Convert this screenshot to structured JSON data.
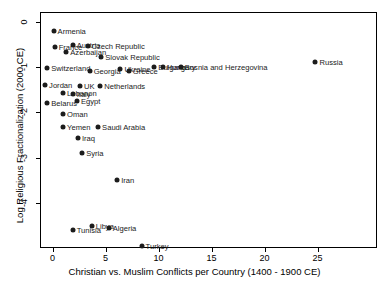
{
  "chart_data": {
    "type": "scatter",
    "title": "",
    "xlabel": "Christian vs. Muslim Conflicts per Country (1400 - 1900 CE)",
    "ylabel": "Log Religious Fractionalization (2000 CE)",
    "x_ticks": [
      0,
      5,
      10,
      15,
      20,
      25
    ],
    "y_ticks": [
      0,
      -1,
      -2,
      -3,
      -4
    ],
    "xlim": [
      -1.18,
      30.6
    ],
    "ylim": [
      -4.98,
      0.21
    ],
    "grid": false,
    "legend": "none",
    "marker_color": "#1c1c1c",
    "points": [
      {
        "label": "Armenia",
        "x": 0.1,
        "y": -0.2
      },
      {
        "label": "France",
        "x": 0.2,
        "y": -0.56
      },
      {
        "label": "Austria",
        "x": 1.9,
        "y": -0.52
      },
      {
        "label": "Czech Republic",
        "x": 3.3,
        "y": -0.54
      },
      {
        "label": "Azerbaijan",
        "x": 1.3,
        "y": -0.67
      },
      {
        "label": "Slovak Republic",
        "x": 4.6,
        "y": -0.78
      },
      {
        "label": "Switzerland",
        "x": -0.5,
        "y": -1.02
      },
      {
        "label": "Georgia",
        "x": 3.5,
        "y": -1.08
      },
      {
        "label": "Ukraine",
        "x": 6.4,
        "y": -1.05
      },
      {
        "label": "Greece",
        "x": 7.2,
        "y": -1.08
      },
      {
        "label": "Bulgaria",
        "x": 9.6,
        "y": -1.0
      },
      {
        "label": "Hungary",
        "x": 10.4,
        "y": -1.0
      },
      {
        "label": "Bosnia and Herzegovina",
        "x": 12.1,
        "y": -1.0
      },
      {
        "label": "Russia",
        "x": 24.8,
        "y": -0.9
      },
      {
        "label": "Jordan",
        "x": -0.7,
        "y": -1.39
      },
      {
        "label": "UK",
        "x": 2.6,
        "y": -1.42
      },
      {
        "label": "Netherlands",
        "x": 4.5,
        "y": -1.42
      },
      {
        "label": "Lebanon",
        "x": 1.0,
        "y": -1.58
      },
      {
        "label": "Italy",
        "x": 1.9,
        "y": -1.6
      },
      {
        "label": "Belarus",
        "x": -0.5,
        "y": -1.8
      },
      {
        "label": "Egypt",
        "x": 2.3,
        "y": -1.75
      },
      {
        "label": "Oman",
        "x": 1.0,
        "y": -2.03
      },
      {
        "label": "Yemen",
        "x": 1.0,
        "y": -2.31
      },
      {
        "label": "Saudi Arabia",
        "x": 4.3,
        "y": -2.31
      },
      {
        "label": "Iraq",
        "x": 2.4,
        "y": -2.57
      },
      {
        "label": "Syria",
        "x": 2.8,
        "y": -2.9
      },
      {
        "label": "Iran",
        "x": 6.1,
        "y": -3.49
      },
      {
        "label": "Tunisia",
        "x": 1.9,
        "y": -4.59
      },
      {
        "label": "Libya",
        "x": 3.7,
        "y": -4.49
      },
      {
        "label": "Algeria",
        "x": 5.3,
        "y": -4.55
      },
      {
        "label": "Turkey",
        "x": 8.4,
        "y": -4.94
      }
    ]
  }
}
